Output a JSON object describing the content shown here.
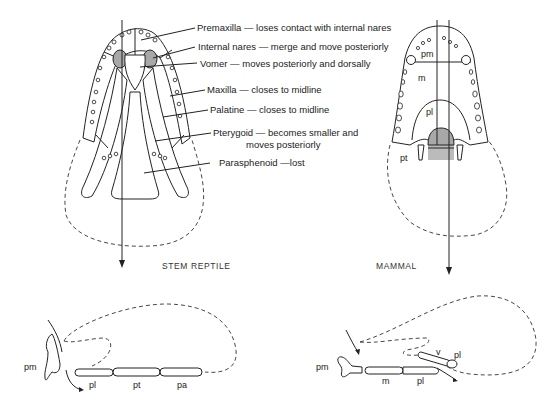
{
  "figure": {
    "panels": [
      {
        "id": "stem-reptile-ventral",
        "caption": "STEM REPTILE",
        "annotations": [
          "Premaxilla — loses contact with internal nares",
          "Internal nares — merge and move posteriorly",
          "Vomer — moves posteriorly and dorsally",
          "Maxilla — closes to midline",
          "Palatine — closes to midline",
          "Pterygoid — becomes smaller and",
          "moves posteriorly",
          "Parasphenoid —lost"
        ]
      },
      {
        "id": "mammal-ventral",
        "caption": "MAMMAL",
        "labels": [
          "pm",
          "m",
          "pl",
          "pt"
        ]
      },
      {
        "id": "stem-reptile-sagittal",
        "labels": [
          "pm",
          "pl",
          "pt",
          "pa"
        ]
      },
      {
        "id": "mammal-sagittal",
        "labels": [
          "pm",
          "m",
          "pl",
          "v",
          "pl"
        ]
      }
    ],
    "colors": {
      "line": "#222222",
      "nares_fill": "#a8a8a8",
      "background": "#ffffff"
    }
  }
}
